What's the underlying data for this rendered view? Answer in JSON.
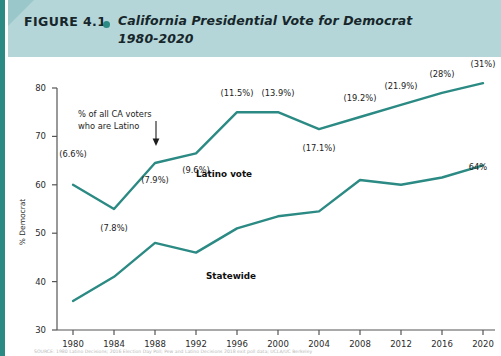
{
  "figure": {
    "label": "FIGURE 4.1",
    "bullet_icon": "teal-dot-icon",
    "title_line1": "California Presidential Vote for Democrat",
    "title_line2": "1980-2020",
    "header_color": "#b5d6d8",
    "accent_color": "#2b8a83"
  },
  "chart_data": {
    "type": "line",
    "title": "California Presidential Vote for Democrat 1980-2020",
    "xlabel": "",
    "ylabel": "% Democrat",
    "x": [
      1980,
      1984,
      1988,
      1992,
      1996,
      2000,
      2004,
      2008,
      2012,
      2016,
      2020
    ],
    "xtick_labels": [
      "1980",
      "1984",
      "1988",
      "1992",
      "1996",
      "2000",
      "2004",
      "2008",
      "2012",
      "2016",
      "2020"
    ],
    "ylim": [
      30,
      80
    ],
    "ytick_labels": [
      "30",
      "40",
      "50",
      "60",
      "70",
      "80"
    ],
    "ytick_values": [
      30,
      40,
      50,
      60,
      70,
      80
    ],
    "grid": false,
    "legend_position": "inline-labels",
    "series": [
      {
        "name": "Latino vote",
        "color": "#2b8a83",
        "values": [
          60.0,
          55.0,
          64.5,
          66.5,
          75.0,
          75.0,
          71.5,
          74.0,
          76.5,
          79.0,
          81.0
        ],
        "point_labels": [
          "(6.6%)",
          "(7.8%)",
          "(7.9%)",
          "(9.6%)",
          "(11.5%)",
          "(13.9%)",
          "(17.1%)",
          "(19.2%)",
          "(21.9%)",
          "(28%)",
          "(31%)"
        ],
        "point_label_note": "share of all California voters who are Latino"
      },
      {
        "name": "Statewide",
        "color": "#2b8a83",
        "values": [
          36.0,
          41.0,
          48.0,
          46.0,
          51.0,
          53.5,
          54.5,
          61.0,
          60.0,
          61.5,
          64.0
        ],
        "end_label": "64%"
      }
    ],
    "annotations": [
      {
        "id": "latino-share-note",
        "text_line1": "% of all CA voters",
        "text_line2": "who are Latino",
        "arrow_icon": "down-arrow-icon",
        "points_to": "(7.9%)"
      },
      {
        "id": "latino-series-label",
        "text": "Latino vote"
      },
      {
        "id": "statewide-series-label",
        "text": "Statewide"
      },
      {
        "id": "statewide-end-value",
        "text": "64%"
      }
    ]
  },
  "source": {
    "text": "SOURCE: 1980 Latino Decisions; 2016 Election Day Poll; Pew and Latino Decisions 2018 exit poll data; UCLA/UC Berkeley"
  }
}
